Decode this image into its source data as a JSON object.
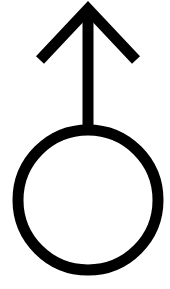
{
  "symbol": {
    "name": "Male symbol (Mars) with upward arrow",
    "stroke_color": "#000000",
    "background_color": "#ffffff",
    "stroke_width": 11,
    "circle": {
      "cx": 88,
      "cy": 200,
      "r": 70
    },
    "stem": {
      "x": 88,
      "y1": 9,
      "y2": 130
    },
    "arrowhead": {
      "apex": [
        88,
        9
      ],
      "left": [
        40,
        60
      ],
      "right": [
        136,
        60
      ]
    }
  }
}
